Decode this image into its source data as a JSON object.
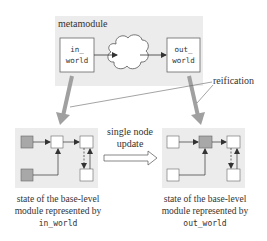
{
  "metamodule": {
    "label": "metamodule",
    "in_box": {
      "line1": "in_",
      "line2": "world"
    },
    "out_box": {
      "line1": "out_",
      "line2": "world"
    }
  },
  "reification_label": "reification",
  "transition": {
    "line1": "single node",
    "line2": "update"
  },
  "left_state": {
    "caption_line1": "state of the base-level",
    "caption_line2": "module represented by",
    "caption_code": "in_world"
  },
  "right_state": {
    "caption_line1": "state of the base-level",
    "caption_line2": "module represented by",
    "caption_code": "out_world"
  },
  "colors": {
    "panel_bg": "#ececec",
    "gray_node": "#a8a8a8",
    "big_arrow": "#a0a0a0",
    "stroke": "#555555"
  }
}
